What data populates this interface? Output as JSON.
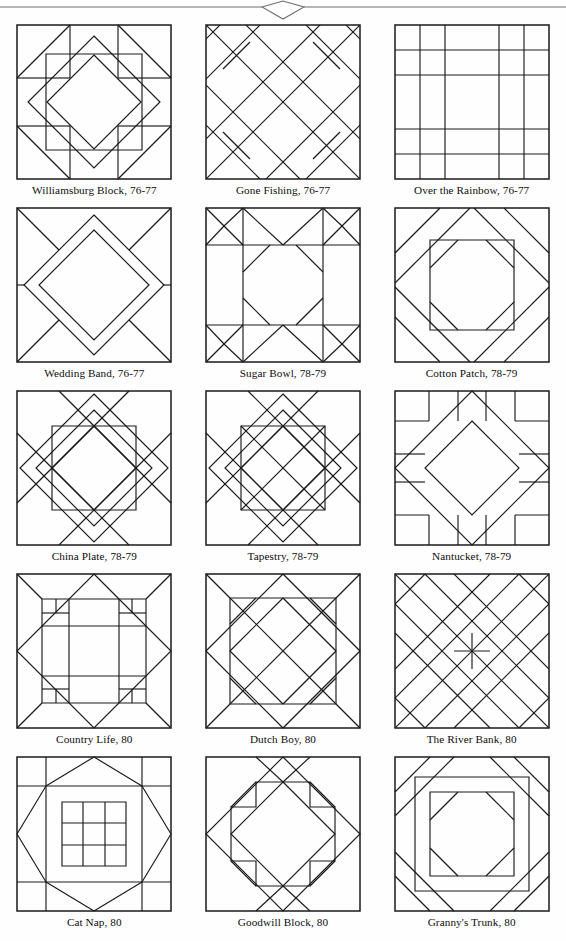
{
  "page": {
    "width": 566,
    "height": 941,
    "background_color": "#ffffff",
    "ink_color": "#1a1a1a",
    "header_ornament": "diamond-rule"
  },
  "blocks": [
    {
      "id": "williamsburg-block",
      "caption": "Williamsburg Block, 76-77",
      "pattern": "williamsburg",
      "row": 1,
      "col": 1
    },
    {
      "id": "gone-fishing",
      "caption": "Gone Fishing, 76-77",
      "pattern": "gonefishing",
      "row": 1,
      "col": 2
    },
    {
      "id": "over-the-rainbow",
      "caption": "Over the Rainbow, 76-77",
      "pattern": "rainbow",
      "row": 1,
      "col": 3
    },
    {
      "id": "wedding-band",
      "caption": "Wedding Band, 76-77",
      "pattern": "weddingband",
      "row": 2,
      "col": 1
    },
    {
      "id": "sugar-bowl",
      "caption": "Sugar Bowl, 78-79",
      "pattern": "sugarbowl",
      "row": 2,
      "col": 2
    },
    {
      "id": "cotton-patch",
      "caption": "Cotton Patch, 78-79",
      "pattern": "cottonpatch",
      "row": 2,
      "col": 3
    },
    {
      "id": "china-plate",
      "caption": "China Plate, 78-79",
      "pattern": "chinaplate",
      "row": 3,
      "col": 1
    },
    {
      "id": "tapestry",
      "caption": "Tapestry, 78-79",
      "pattern": "tapestry",
      "row": 3,
      "col": 2
    },
    {
      "id": "nantucket",
      "caption": "Nantucket, 78-79",
      "pattern": "nantucket",
      "row": 3,
      "col": 3
    },
    {
      "id": "country-life",
      "caption": "Country Life, 80",
      "pattern": "countrylife",
      "row": 4,
      "col": 1
    },
    {
      "id": "dutch-boy",
      "caption": "Dutch Boy, 80",
      "pattern": "dutchboy",
      "row": 4,
      "col": 2
    },
    {
      "id": "the-river-bank",
      "caption": "The River Bank, 80",
      "pattern": "riverbank",
      "row": 4,
      "col": 3
    },
    {
      "id": "cat-nap",
      "caption": "Cat Nap, 80",
      "pattern": "catnap",
      "row": 5,
      "col": 1
    },
    {
      "id": "goodwill-block",
      "caption": "Goodwill Block, 80",
      "pattern": "goodwill",
      "row": 5,
      "col": 2
    },
    {
      "id": "grannys-trunk",
      "caption": "Granny's Trunk, 80",
      "pattern": "grannystrunk",
      "row": 5,
      "col": 3
    }
  ]
}
